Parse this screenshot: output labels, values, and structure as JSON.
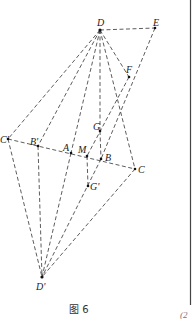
{
  "figure": {
    "caption": "图 6",
    "edge_text": "(2",
    "points": [
      {
        "id": "D",
        "label": "D",
        "x": 100,
        "y": 30
      },
      {
        "id": "E",
        "label": "E",
        "x": 155,
        "y": 28
      },
      {
        "id": "F",
        "label": "F",
        "x": 129,
        "y": 77
      },
      {
        "id": "G",
        "label": "G",
        "x": 100,
        "y": 131
      },
      {
        "id": "Cp",
        "label": "C'",
        "x": 8,
        "y": 139
      },
      {
        "id": "Bp",
        "label": "B'",
        "x": 38,
        "y": 146
      },
      {
        "id": "A",
        "label": "A",
        "x": 71,
        "y": 153
      },
      {
        "id": "M",
        "label": "M",
        "x": 87,
        "y": 156
      },
      {
        "id": "B",
        "label": "B",
        "x": 101,
        "y": 159
      },
      {
        "id": "C",
        "label": "C",
        "x": 135,
        "y": 169
      },
      {
        "id": "Gp",
        "label": "G'",
        "x": 88,
        "y": 186
      },
      {
        "id": "Dp",
        "label": "D'",
        "x": 42,
        "y": 277
      }
    ],
    "segments": [
      [
        "D",
        "E"
      ],
      [
        "E",
        "B"
      ],
      [
        "F",
        "M"
      ],
      [
        "D",
        "F"
      ],
      [
        "D",
        "Cp"
      ],
      [
        "D",
        "Bp"
      ],
      [
        "D",
        "A"
      ],
      [
        "D",
        "G"
      ],
      [
        "G",
        "B"
      ],
      [
        "D",
        "C"
      ],
      [
        "Cp",
        "C"
      ],
      [
        "Cp",
        "Dp"
      ],
      [
        "Bp",
        "Dp"
      ],
      [
        "A",
        "Dp"
      ],
      [
        "B",
        "Dp"
      ],
      [
        "C",
        "Dp"
      ],
      [
        "M",
        "Gp"
      ]
    ]
  }
}
